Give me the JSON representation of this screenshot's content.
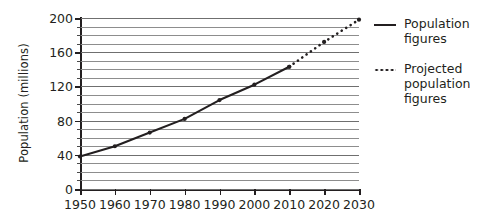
{
  "chart_data": {
    "type": "line",
    "title": "",
    "xlabel": "",
    "ylabel": "Population (millions)",
    "xlim": [
      1950,
      2030
    ],
    "ylim": [
      0,
      200
    ],
    "xticks": [
      1950,
      1960,
      1970,
      1980,
      1990,
      2000,
      2010,
      2020,
      2030
    ],
    "yticks": [
      0,
      40,
      80,
      120,
      160,
      200
    ],
    "yminor_step": 10,
    "grid": "horizontal",
    "legend_position": "right",
    "x": [
      1950,
      1960,
      1970,
      1980,
      1990,
      2000,
      2010,
      2020,
      2030
    ],
    "series": [
      {
        "name": "Population figures",
        "style": "solid",
        "color": "#231f20",
        "x": [
          1950,
          1960,
          1970,
          1980,
          1990,
          2000,
          2010
        ],
        "values": [
          38,
          50,
          66,
          82,
          104,
          122,
          143
        ]
      },
      {
        "name": "Projected population figures",
        "style": "dotted",
        "color": "#231f20",
        "x": [
          2010,
          2020,
          2030
        ],
        "values": [
          143,
          172,
          198
        ]
      }
    ]
  },
  "axes": {
    "y_title": "Population (millions)",
    "y_tick_labels": [
      "0",
      "40",
      "80",
      "120",
      "160",
      "200"
    ],
    "x_tick_labels": [
      "1950",
      "1960",
      "1970",
      "1980",
      "1990",
      "2000",
      "2010",
      "2020",
      "2030"
    ]
  },
  "legend": {
    "entries": [
      {
        "label": "Population figures",
        "style": "solid"
      },
      {
        "label": "Projected population figures",
        "style": "dotted"
      }
    ]
  },
  "colors": {
    "line": "#231f20",
    "gridline": "#8d8d8d",
    "axis": "#231f20",
    "background": "#ffffff"
  }
}
